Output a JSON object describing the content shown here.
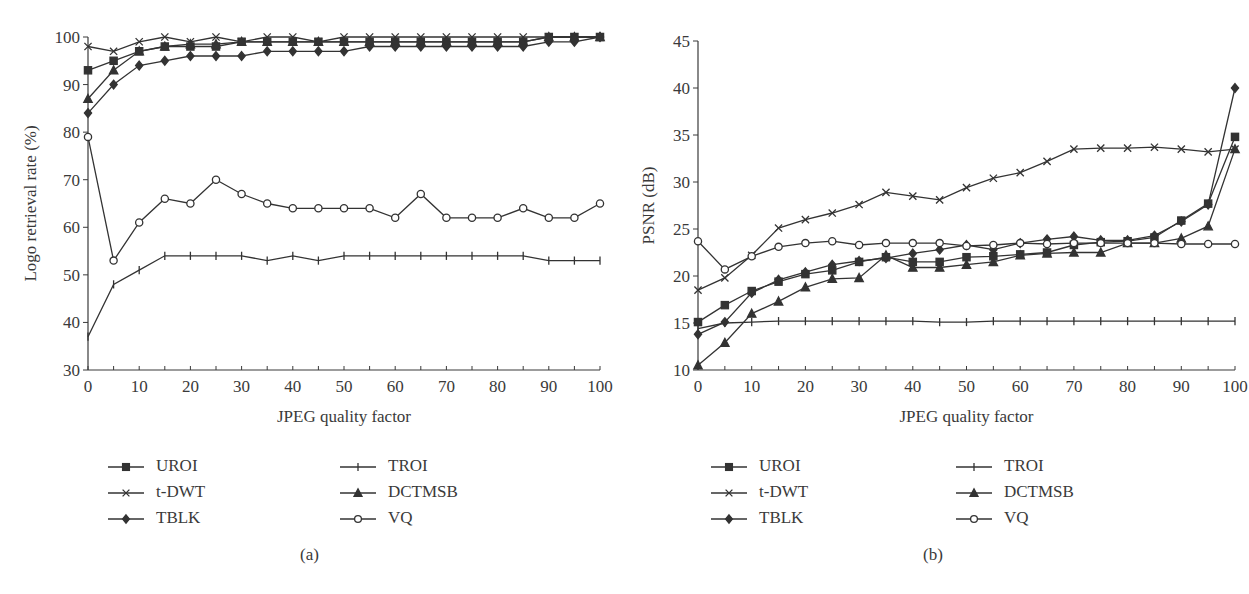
{
  "chart_data": [
    {
      "id": "a",
      "type": "line",
      "caption": "(a)",
      "title": "",
      "xlabel": "JPEG quality factor",
      "ylabel": "Logo retrieval rate (%)",
      "xlim": [
        0,
        100
      ],
      "ylim": [
        30,
        100
      ],
      "xticks": [
        0,
        10,
        20,
        30,
        40,
        50,
        60,
        70,
        80,
        90,
        100
      ],
      "yticks": [
        30,
        40,
        50,
        60,
        70,
        80,
        90,
        100
      ],
      "grid": false,
      "legend_position": "below",
      "x": [
        0,
        5,
        10,
        15,
        20,
        25,
        30,
        35,
        40,
        45,
        50,
        55,
        60,
        65,
        70,
        75,
        80,
        85,
        90,
        95,
        100
      ],
      "series": [
        {
          "name": "UROI",
          "marker": "square",
          "values": [
            93,
            95,
            97,
            98,
            98,
            98,
            99,
            99,
            99,
            99,
            99,
            99,
            99,
            99,
            99,
            99,
            99,
            99,
            100,
            100,
            100
          ]
        },
        {
          "name": "t-DWT",
          "marker": "x",
          "values": [
            98,
            97,
            99,
            100,
            99,
            100,
            99,
            100,
            100,
            99,
            100,
            100,
            100,
            100,
            100,
            100,
            100,
            100,
            100,
            100,
            100
          ]
        },
        {
          "name": "TBLK",
          "marker": "diamond",
          "values": [
            84,
            90,
            94,
            95,
            96,
            96,
            96,
            97,
            97,
            97,
            97,
            98,
            98,
            98,
            98,
            98,
            98,
            98,
            99,
            99,
            100
          ]
        },
        {
          "name": "TROI",
          "marker": "plus",
          "values": [
            37,
            48,
            51,
            54,
            54,
            54,
            54,
            53,
            54,
            53,
            54,
            54,
            54,
            54,
            54,
            54,
            54,
            54,
            53,
            53,
            53
          ]
        },
        {
          "name": "DCTMSB",
          "marker": "triangle",
          "values": [
            87,
            93,
            97,
            98,
            98.5,
            98.5,
            99,
            99,
            99,
            99,
            99,
            99,
            99,
            99,
            99,
            99,
            99,
            99,
            100,
            100,
            100
          ]
        },
        {
          "name": "VQ",
          "marker": "circle",
          "values": [
            79,
            53,
            61,
            66,
            65,
            70,
            67,
            65,
            64,
            64,
            64,
            64,
            62,
            67,
            62,
            62,
            62,
            64,
            62,
            62,
            65
          ]
        }
      ]
    },
    {
      "id": "b",
      "type": "line",
      "caption": "(b)",
      "title": "",
      "xlabel": "JPEG quality factor",
      "ylabel": "PSNR (dB)",
      "xlim": [
        0,
        100
      ],
      "ylim": [
        10,
        45
      ],
      "xticks": [
        0,
        10,
        20,
        30,
        40,
        50,
        60,
        70,
        80,
        90,
        100
      ],
      "yticks": [
        10,
        15,
        20,
        25,
        30,
        35,
        40,
        45
      ],
      "grid": false,
      "legend_position": "below",
      "x": [
        0,
        5,
        10,
        15,
        20,
        25,
        30,
        35,
        40,
        45,
        50,
        55,
        60,
        65,
        70,
        75,
        80,
        85,
        90,
        95,
        100
      ],
      "series": [
        {
          "name": "UROI",
          "marker": "square",
          "values": [
            15.1,
            16.9,
            18.4,
            19.4,
            20.2,
            20.6,
            21.5,
            22.0,
            21.5,
            21.5,
            22.0,
            22.1,
            22.3,
            22.5,
            23.3,
            23.6,
            23.7,
            24.1,
            25.9,
            27.7,
            34.8
          ]
        },
        {
          "name": "t-DWT",
          "marker": "x",
          "values": [
            18.5,
            19.8,
            22.2,
            25.1,
            26.0,
            26.7,
            27.6,
            28.9,
            28.5,
            28.1,
            29.4,
            30.4,
            31.0,
            32.2,
            33.5,
            33.6,
            33.6,
            33.7,
            33.5,
            33.2,
            33.5
          ]
        },
        {
          "name": "TBLK",
          "marker": "diamond",
          "values": [
            13.8,
            15.1,
            18.2,
            19.6,
            20.4,
            21.2,
            21.6,
            21.9,
            22.4,
            22.8,
            23.3,
            22.8,
            23.5,
            23.9,
            24.2,
            23.8,
            23.8,
            24.3,
            25.8,
            27.6,
            40.0
          ]
        },
        {
          "name": "TROI",
          "marker": "plus",
          "values": [
            14.4,
            15.0,
            15.1,
            15.2,
            15.2,
            15.2,
            15.2,
            15.2,
            15.2,
            15.1,
            15.1,
            15.2,
            15.2,
            15.2,
            15.2,
            15.2,
            15.2,
            15.2,
            15.2,
            15.2,
            15.2
          ]
        },
        {
          "name": "DCTMSB",
          "marker": "triangle",
          "values": [
            10.5,
            12.9,
            16.0,
            17.3,
            18.8,
            19.7,
            19.8,
            22.2,
            20.9,
            20.9,
            21.2,
            21.5,
            22.2,
            22.4,
            22.5,
            22.5,
            23.5,
            23.5,
            24.0,
            25.3,
            33.5
          ]
        },
        {
          "name": "VQ",
          "marker": "circle",
          "values": [
            23.7,
            20.7,
            22.1,
            23.1,
            23.5,
            23.7,
            23.3,
            23.5,
            23.5,
            23.5,
            23.2,
            23.3,
            23.5,
            23.4,
            23.5,
            23.5,
            23.5,
            23.5,
            23.4,
            23.4,
            23.4
          ]
        }
      ]
    }
  ],
  "panels": {
    "a": {
      "caption": "(a)",
      "xlabel": "JPEG quality factor",
      "ylabel": "Logo retrieval rate (%)",
      "legend": [
        "UROI",
        "t-DWT",
        "TBLK",
        "TROI",
        "DCTMSB",
        "VQ"
      ]
    },
    "b": {
      "caption": "(b)",
      "xlabel": "JPEG quality factor",
      "ylabel": "PSNR (dB)",
      "legend": [
        "UROI",
        "t-DWT",
        "TBLK",
        "TROI",
        "DCTMSB",
        "VQ"
      ]
    }
  },
  "colors": {
    "line": "#333333",
    "text": "#3a3a3a",
    "background": "#ffffff"
  }
}
